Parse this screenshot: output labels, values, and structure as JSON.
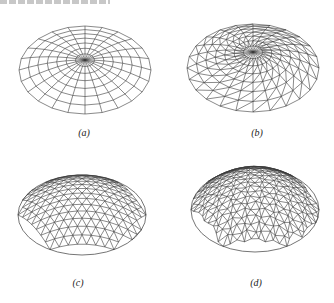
{
  "figure": {
    "top_text_fragment": "",
    "panels": [
      {
        "id": "a",
        "label": "(a)",
        "mesh": "radial quadrilateral grid (Kiewitt-like dome, rings + ribs)",
        "rings": 7,
        "ribs": 24
      },
      {
        "id": "b",
        "label": "(b)",
        "mesh": "radial ribs with triangulated diagonals",
        "rings": 7,
        "ribs": 24
      },
      {
        "id": "c",
        "label": "(c)",
        "mesh": "regular triangular grid dome"
      },
      {
        "id": "d",
        "label": "(d)",
        "mesh": "geodesic-like irregular triangular dome"
      }
    ]
  },
  "colors": {
    "line": "#3a3a3a",
    "background": "#ffffff",
    "caption": "#222222"
  }
}
